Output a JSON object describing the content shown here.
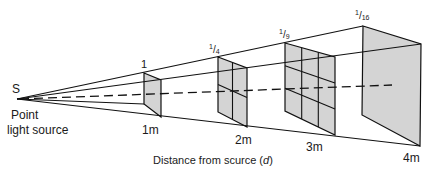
{
  "diagram": {
    "source": {
      "symbol": "S",
      "label_line1": "Point",
      "label_line2": "light source"
    },
    "panels": [
      {
        "distance": "1m",
        "intensity": "1",
        "intensity_num": "",
        "intensity_den": "",
        "grid": 1
      },
      {
        "distance": "2m",
        "intensity": "1/4",
        "intensity_num": "1",
        "intensity_den": "4",
        "grid": 2
      },
      {
        "distance": "3m",
        "intensity": "1/9",
        "intensity_num": "1",
        "intensity_den": "9",
        "grid": 3
      },
      {
        "distance": "4m",
        "intensity": "1/16",
        "intensity_num": "1",
        "intensity_den": "16",
        "grid": 4
      }
    ],
    "axis_label_prefix": "Distance from scurce (",
    "axis_label_var": "d",
    "axis_label_suffix": ")",
    "colors": {
      "line": "#111111",
      "panel_fill": "#d4d4d4",
      "background": "#ffffff"
    }
  }
}
